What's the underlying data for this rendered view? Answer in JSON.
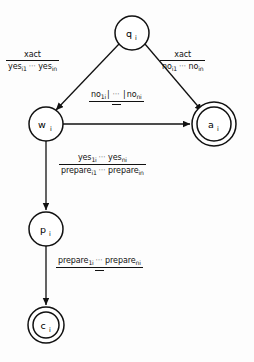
{
  "figure": {
    "type": "finite-state-automaton",
    "stroke_color": "#111111",
    "background_color": "#fdfdfd"
  },
  "nodes": [
    {
      "id": "q",
      "label": "q",
      "subscript": "i",
      "shape": "circle",
      "cx": 132,
      "cy": 33,
      "r": 17
    },
    {
      "id": "w",
      "label": "w",
      "subscript": "i",
      "shape": "circle",
      "cx": 46,
      "cy": 124,
      "r": 17
    },
    {
      "id": "a",
      "label": "a",
      "subscript": "i",
      "shape": "double-circle",
      "cx": 214,
      "cy": 124,
      "r": 17,
      "r_outer": 22
    },
    {
      "id": "p",
      "label": "p",
      "subscript": "i",
      "shape": "circle",
      "cx": 46,
      "cy": 229,
      "r": 17
    },
    {
      "id": "c",
      "label": "c",
      "subscript": "i",
      "shape": "double-circle",
      "cx": 46,
      "cy": 325,
      "r": 13,
      "r_outer": 18
    }
  ],
  "edges": [
    {
      "id": "q-to-w",
      "from": "q",
      "to": "w",
      "label_id": "lbl-left"
    },
    {
      "id": "q-to-a",
      "from": "q",
      "to": "a",
      "label_id": "lbl-right"
    },
    {
      "id": "w-to-a",
      "from": "w",
      "to": "a",
      "label_id": "lbl-mid"
    },
    {
      "id": "w-to-p",
      "from": "w",
      "to": "p",
      "label_id": "lbl-lower"
    },
    {
      "id": "p-to-c",
      "from": "p",
      "to": "c",
      "label_id": "lbl-bottom"
    }
  ],
  "labels": {
    "left": {
      "numerator": "xact",
      "denominator_first": "yes",
      "denominator_first_sub": "i1",
      "denominator_dots": "⋯",
      "denominator_last": "yes",
      "denominator_last_sub": "in"
    },
    "right": {
      "numerator": "xact",
      "denominator_first": "no",
      "denominator_first_sub": "i1",
      "denominator_dots": "⋯",
      "denominator_last": "no",
      "denominator_last_sub": "in"
    },
    "middle": {
      "numerator_first": "no",
      "numerator_first_sub": "1i",
      "numerator_sep_left": "|",
      "numerator_dots": "⋯",
      "numerator_sep_right": "|",
      "numerator_last": "no",
      "numerator_last_sub": "ni",
      "denominator": "—"
    },
    "lower": {
      "numerator_first": "yes",
      "numerator_first_sub": "1i",
      "numerator_dots": "⋯",
      "numerator_last": "yes",
      "numerator_last_sub": "ni",
      "denominator_first": "prepare",
      "denominator_first_sub": "i1",
      "denominator_dots": "⋯",
      "denominator_last": "prepare",
      "denominator_last_sub": "in"
    },
    "bottom": {
      "numerator_first": "prepare",
      "numerator_first_sub": "1i",
      "numerator_dots": "⋯",
      "numerator_last": "prepare",
      "numerator_last_sub": "ni",
      "denominator": "—"
    }
  }
}
